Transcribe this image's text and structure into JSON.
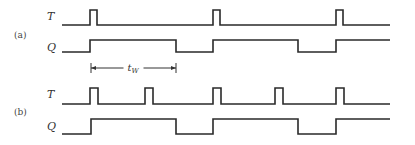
{
  "diagram": {
    "type": "timing-diagram",
    "x_end": 390,
    "panels": [
      {
        "label": "(a)",
        "signals": [
          {
            "name": "T",
            "kind": "pulses",
            "start": 62,
            "pulses": [
              [
                90,
                97
              ],
              [
                213,
                220
              ],
              [
                336,
                343
              ]
            ]
          },
          {
            "name": "Q",
            "kind": "levels",
            "start": 62,
            "initial": 0,
            "transitions": [
              90,
              176,
              213,
              298,
              336
            ]
          }
        ],
        "annotation": {
          "label": "t",
          "subscript": "W",
          "from": 91,
          "to": 176
        }
      },
      {
        "label": "(b)",
        "signals": [
          {
            "name": "T",
            "kind": "pulses",
            "start": 62,
            "pulses": [
              [
                90,
                98
              ],
              [
                145,
                153
              ],
              [
                213,
                221
              ],
              [
                275,
                283
              ],
              [
                336,
                344
              ]
            ]
          },
          {
            "name": "Q",
            "kind": "levels",
            "start": 62,
            "initial": 0,
            "transitions": [
              91,
              176,
              213,
              298,
              336
            ]
          }
        ]
      }
    ]
  }
}
